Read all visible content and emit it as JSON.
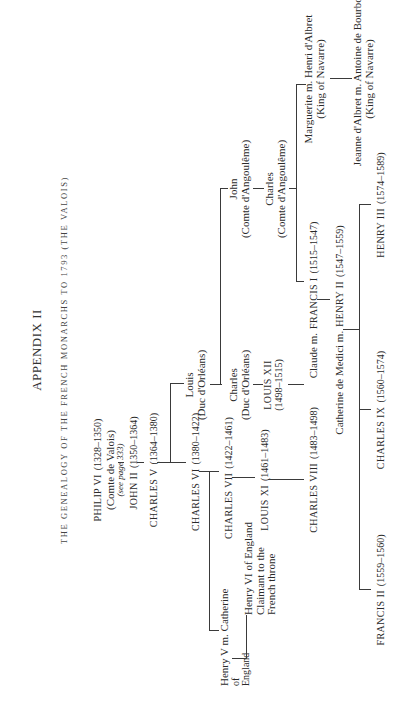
{
  "header": {
    "title": "APPENDIX II",
    "subtitle": "THE GENEALOGY OF THE FRENCH MONARCHS TO 1793 (THE VALOIS)"
  },
  "people": {
    "philip_vi": {
      "name": "PHILIP VI",
      "dates": "(1328–1350)",
      "note": "(Comte de Valois)",
      "ref": "(see page 333)"
    },
    "john_ii": {
      "name": "JOHN II",
      "dates": "(1350–1364)"
    },
    "charles_v": {
      "name": "CHARLES V",
      "dates": "(1364–1380)"
    },
    "charles_vi": {
      "name": "CHARLES VI",
      "dates": "(1380–1422)"
    },
    "louis_orleans": {
      "name": "Louis",
      "note": "(Duc d'Orléans)"
    },
    "henry_v_marriage": {
      "line1": "Henry V m. Catherine",
      "line2": "of",
      "line3": "England"
    },
    "charles_vii": {
      "name": "CHARLES VII",
      "dates": "(1422–1461)"
    },
    "henry_vi": {
      "line1": "Henry VI of England",
      "line2": "Claimant to the",
      "line3": "French throne"
    },
    "louis_xi": {
      "name": "LOUIS XI",
      "dates": "(1461–1483)"
    },
    "charles_orleans": {
      "name": "Charles",
      "note": "(Duc d'Orléans)"
    },
    "louis_xii": {
      "name": "LOUIS XII",
      "dates": "(1498–1515)"
    },
    "charles_viii": {
      "name": "CHARLES VIII",
      "dates": "(1483–1498)"
    },
    "john_angouleme": {
      "name": "John",
      "note": "(Comte d'Angoulême)"
    },
    "charles_angouleme": {
      "name": "Charles",
      "note": "(Comte d'Angoulême)"
    },
    "claude_francis_i": {
      "prefix": "Claude m.",
      "name": "FRANCIS I",
      "dates": "(1515–1547)"
    },
    "marguerite": {
      "line1": "Marguerite m. Henri d'Albret",
      "line2": "(King of Navarre)"
    },
    "jeanne": {
      "line1": "Jeanne d'Albret m. Antoine de Bourbon",
      "line2": "(King of Navarre)"
    },
    "catherine_henry_ii": {
      "prefix": "Catherine de Medici m.",
      "name": "HENRY II",
      "dates": "(1547–1559)"
    },
    "francis_ii": {
      "name": "FRANCIS II",
      "dates": "(1559–1560)"
    },
    "charles_ix": {
      "name": "CHARLES IX",
      "dates": "(1560–1574)"
    },
    "henry_iii": {
      "name": "HENRY III",
      "dates": "(1574–1589)"
    }
  }
}
